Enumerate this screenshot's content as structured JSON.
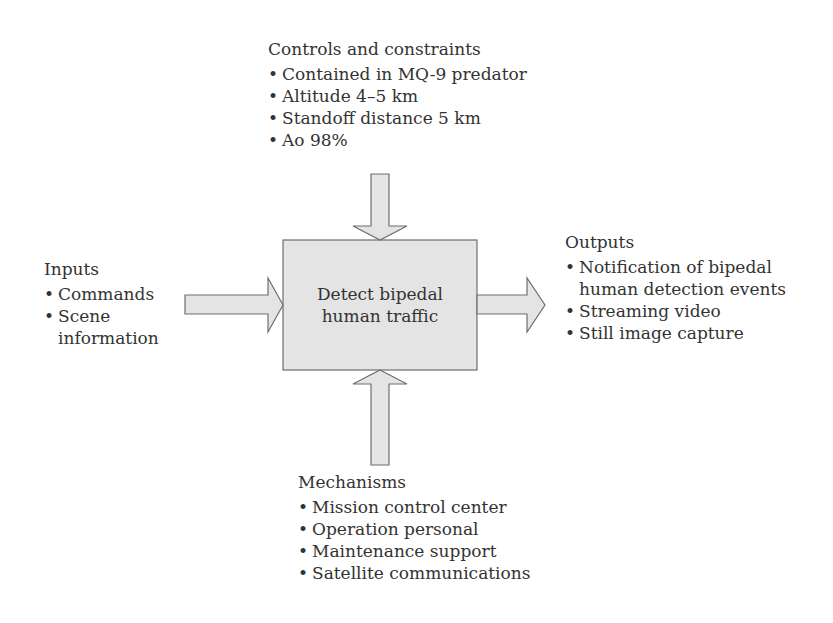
{
  "diagram": {
    "type": "IDEF0 function block",
    "process": {
      "label": "Detect bipedal human traffic"
    },
    "controls": {
      "title": "Controls and constraints",
      "items": [
        "Contained in MQ-9 predator",
        "Altitude 4–5 km",
        "Standoff distance 5 km",
        "Ao 98%"
      ]
    },
    "inputs": {
      "title": "Inputs",
      "items": [
        "Commands",
        "Scene information"
      ]
    },
    "outputs": {
      "title": "Outputs",
      "items": [
        "Notification of bipedal human detection events",
        "Streaming video",
        "Still image capture"
      ]
    },
    "mechanisms": {
      "title": "Mechanisms",
      "items": [
        "Mission control center",
        "Operation personal",
        "Maintenance support",
        "Satellite communications"
      ]
    },
    "colors": {
      "fill": "#e4e4e4",
      "stroke": "#6e6e6e",
      "text": "#333333"
    }
  }
}
